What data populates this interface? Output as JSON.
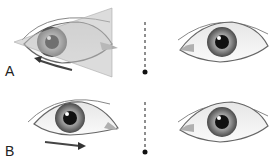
{
  "panels": [
    {
      "label": "A",
      "arrow_direction": "left",
      "triangle_overlay": true
    },
    {
      "label": "B",
      "arrow_direction": "right",
      "triangle_overlay": false
    }
  ],
  "colors": {
    "sclera": "#f4f4f4",
    "iris_outer": "#5a5a5a",
    "iris_inner": "#b8b8b8",
    "pupil": "#111111",
    "lid_line": "#777777",
    "triangle_fill": "#c8c8c8",
    "arrow": "#333333",
    "dash": "#444444"
  }
}
